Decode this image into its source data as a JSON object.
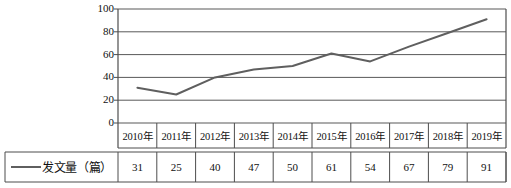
{
  "chart_data": {
    "type": "line",
    "title": "",
    "xlabel": "",
    "ylabel": "",
    "categories": [
      "2010年",
      "2011年",
      "2012年",
      "2013年",
      "2014年",
      "2015年",
      "2016年",
      "2017年",
      "2018年",
      "2019年"
    ],
    "series": [
      {
        "name": "发文量（篇）",
        "values": [
          31,
          25,
          40,
          47,
          50,
          61,
          54,
          67,
          79,
          91
        ],
        "color": "#5f5f5f"
      }
    ],
    "ylim": [
      0,
      100
    ],
    "yticks": [
      0,
      20,
      40,
      60,
      80,
      100
    ],
    "ytick_labels": [
      "0",
      "20",
      "40",
      "60",
      "80",
      "100"
    ],
    "grid": true,
    "grid_axis": "y",
    "grid_color": "#595959",
    "legend_position": "bottom-table",
    "data_table": {
      "row_header": "发文量（篇）",
      "columns": [
        "2010年",
        "2011年",
        "2012年",
        "2013年",
        "2014年",
        "2015年",
        "2016年",
        "2017年",
        "2018年",
        "2019年"
      ],
      "values": [
        "31",
        "25",
        "40",
        "47",
        "50",
        "61",
        "54",
        "67",
        "79",
        "91"
      ]
    },
    "axis_color": "#4d4d4d",
    "background": "#ffffff"
  }
}
